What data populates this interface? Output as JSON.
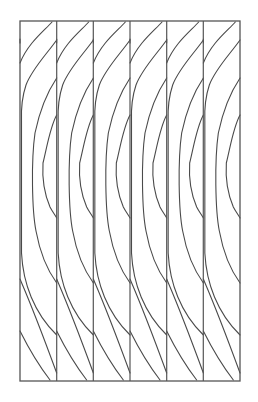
{
  "figure": {
    "stroke_color": "#4a4a4a",
    "frame_color": "#555555",
    "background": "#ffffff",
    "frame": {
      "x": 20,
      "y": 21,
      "width": 220,
      "height": 360
    },
    "strip_count": 6,
    "dividers_x": [
      56.7,
      93.3,
      130,
      166.7,
      203.3
    ],
    "strip_template_arcs": [
      "M 32 1 C 24 10, 8 22, 0 42",
      "M 36.7 19 C 26 34, 12 48, 6 64 C 2 76, 1 88, 1.5 100 L 1.5 232 C 3 262, 14 292, 36.7 314",
      "M 36.7 57 C 28 70, 20 88, 15 112 C 11 140, 12 190, 16 210 C 20 232, 28 250, 36.7 262",
      "M 36.7 94 C 30 106, 27 126, 23 142 C 22 158, 24 172, 30 186 C 32 190, 35 194, 36.7 197",
      "M 0 18 C 0 20, 0 21, 0 22",
      "M 0 258 C 6 272, 14 290, 36.7 352",
      "M 0 310 C 8 326, 20 346, 30 359"
    ]
  }
}
